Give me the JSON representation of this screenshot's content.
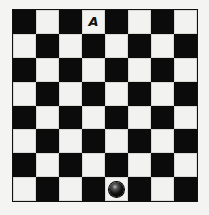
{
  "board": {
    "rows": 8,
    "cols": 8,
    "top_left_color": "dark",
    "colors": {
      "dark": "#0b0b0b",
      "light": "#f2f2f0"
    }
  },
  "pieces": [
    {
      "type": "label",
      "text": "A",
      "row": 0,
      "col": 3
    },
    {
      "type": "ball",
      "row": 7,
      "col": 4
    }
  ]
}
